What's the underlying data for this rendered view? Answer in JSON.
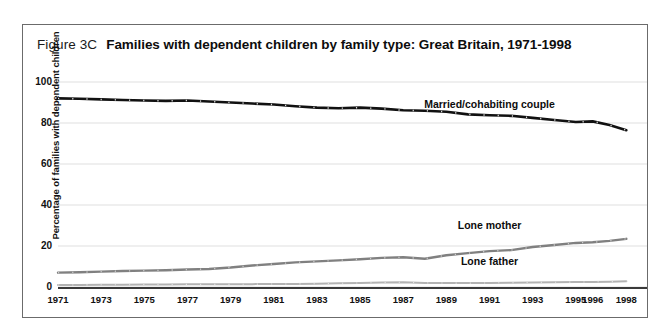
{
  "figure": {
    "number": "Figure 3C",
    "title": "Families with dependent children by family type:  Great Britain, 1971-1998"
  },
  "chart_data": {
    "type": "line",
    "title": "Families with dependent children by family type:  Great Britain, 1971-1998",
    "xlabel": "",
    "ylabel": "Percentage of families with dependent children",
    "ylim": [
      0,
      100
    ],
    "yticks": [
      0,
      20,
      40,
      60,
      80,
      100
    ],
    "xticks": [
      "1971",
      "1973",
      "1975",
      "1977",
      "1979",
      "1981",
      "1983",
      "1985",
      "1987",
      "1989",
      "1991",
      "1993",
      "1995",
      "1996",
      "1998"
    ],
    "grid": true,
    "legend_position": "inline-labels",
    "x": [
      1971,
      1972,
      1973,
      1974,
      1975,
      1976,
      1977,
      1978,
      1979,
      1980,
      1981,
      1982,
      1983,
      1984,
      1985,
      1986,
      1987,
      1988,
      1989,
      1990,
      1991,
      1992,
      1993,
      1994,
      1995,
      1996,
      1997,
      1998
    ],
    "series": [
      {
        "name": "Married/cohabiting couple",
        "color": "#111111",
        "values": [
          92,
          91.8,
          91.5,
          91.2,
          91,
          90.8,
          91,
          90.5,
          90,
          89.5,
          89,
          88.2,
          87.5,
          87.2,
          87.5,
          87,
          86.2,
          86,
          85.5,
          84.2,
          83.8,
          83.5,
          82.5,
          81.5,
          80.5,
          80.8,
          79,
          76.5
        ]
      },
      {
        "name": "Lone mother",
        "color": "#808080",
        "values": [
          7,
          7.2,
          7.5,
          7.8,
          8,
          8.2,
          8.5,
          8.8,
          9.5,
          10.5,
          11.2,
          12,
          12.5,
          13,
          13.5,
          14.2,
          14.5,
          13.8,
          15.5,
          16.5,
          17.5,
          18,
          19.5,
          20.5,
          21.5,
          21.8,
          22.5,
          23.5
        ]
      },
      {
        "name": "Lone father",
        "color": "#b3b3b3",
        "values": [
          1,
          1,
          1.1,
          1.1,
          1.2,
          1.2,
          1.3,
          1.3,
          1.3,
          1.4,
          1.5,
          1.5,
          1.6,
          1.8,
          2,
          2.2,
          2.3,
          2,
          1.9,
          1.9,
          2,
          2.1,
          2.2,
          2.3,
          2.4,
          2.5,
          2.6,
          2.8
        ]
      }
    ],
    "annotations": [
      {
        "text": "Married/cohabiting couple",
        "x": 1991,
        "y": 89
      },
      {
        "text": "Lone mother",
        "x": 1991,
        "y": 30
      },
      {
        "text": "Lone father",
        "x": 1991,
        "y": 12
      }
    ]
  }
}
